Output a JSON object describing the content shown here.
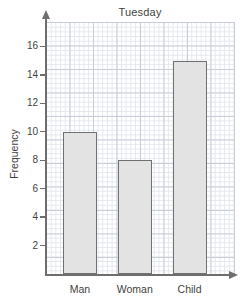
{
  "chart_data": {
    "type": "bar",
    "title": "Tuesday",
    "xlabel": "",
    "ylabel": "Frequency",
    "categories": [
      "Man",
      "Woman",
      "Child"
    ],
    "values": [
      10,
      8,
      15
    ],
    "ylim": [
      0,
      18
    ],
    "ytick_labels": [
      "2",
      "4",
      "6",
      "8",
      "10",
      "12",
      "14",
      "16"
    ],
    "ytick_values": [
      2,
      4,
      6,
      8,
      10,
      12,
      14,
      16
    ],
    "grid": true,
    "grid_style": "graph-paper minor squares with major line every 5 cells",
    "legend": "none",
    "bar_fill_color": "#e3e3e3",
    "bar_border_color": "#707070",
    "axis_color": "#6e6e6e",
    "text_color": "#3f3f3f"
  }
}
